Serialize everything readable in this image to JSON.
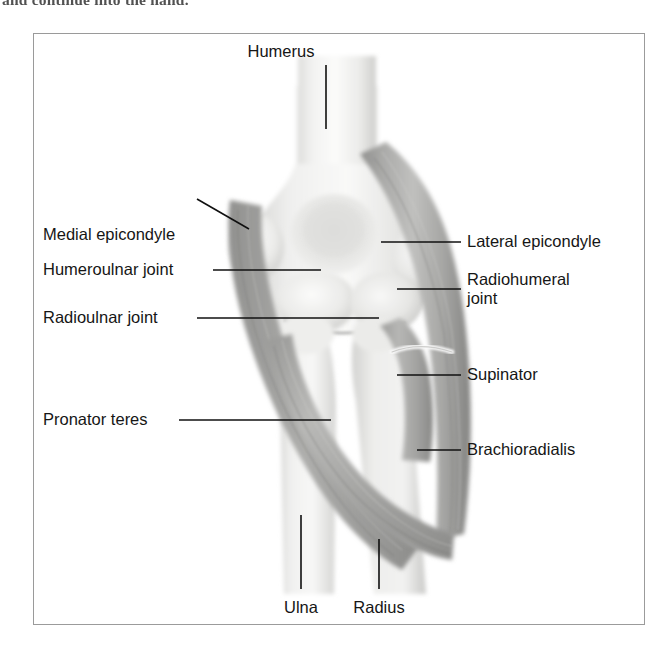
{
  "page": {
    "caption_above_figure": "and continue into the hand.",
    "figure_subject": "Anatomy of the elbow: bones and forearm muscles"
  },
  "figure": {
    "frame": {
      "x": 33,
      "y": 33,
      "width": 612,
      "height": 592,
      "border_color": "#9a9a9a"
    },
    "background_color": "#ffffff"
  },
  "labels": [
    {
      "id": "humerus",
      "text": "Humerus",
      "position": "top-center",
      "text_x": 325,
      "text_y": 52,
      "leader": {
        "type": "vertical",
        "x1": 325,
        "y1": 64,
        "x2": 325,
        "y2": 128
      }
    },
    {
      "id": "medial-epicondyle",
      "text": "Medial epicondyle",
      "position": "left",
      "text_x": 42,
      "text_y": 202,
      "leader": {
        "type": "diagonal",
        "x1": 196,
        "y1": 198,
        "x2": 248,
        "y2": 228
      }
    },
    {
      "id": "humeroulnar-joint",
      "text": "Humeroulnar joint",
      "position": "left",
      "text_x": 42,
      "text_y": 272,
      "leader": {
        "type": "horizontal",
        "x1": 212,
        "y1": 269,
        "x2": 320,
        "y2": 269
      }
    },
    {
      "id": "radioulnar-joint",
      "text": "Radioulnar joint",
      "position": "left",
      "text_x": 42,
      "text_y": 320,
      "leader": {
        "type": "horizontal",
        "x1": 196,
        "y1": 317,
        "x2": 378,
        "y2": 317
      }
    },
    {
      "id": "pronator-teres",
      "text": "Pronator teres",
      "position": "left",
      "text_x": 42,
      "text_y": 422,
      "leader": {
        "type": "horizontal",
        "x1": 178,
        "y1": 419,
        "x2": 330,
        "y2": 419
      }
    },
    {
      "id": "lateral-epicondyle",
      "text": "Lateral epicondyle",
      "position": "right",
      "text_x": 466,
      "text_y": 243,
      "leader": {
        "type": "horizontal",
        "x1": 380,
        "y1": 241,
        "x2": 460,
        "y2": 241
      }
    },
    {
      "id": "radiohumeral-joint",
      "text": "Radiohumeral joint",
      "position": "right",
      "text_x": 466,
      "text_y": 282,
      "line_1": "Radiohumeral",
      "line_2": "joint",
      "leader": {
        "type": "horizontal",
        "x1": 396,
        "y1": 288,
        "x2": 460,
        "y2": 288
      }
    },
    {
      "id": "supinator",
      "text": "Supinator",
      "position": "right",
      "text_x": 466,
      "text_y": 377,
      "leader": {
        "type": "horizontal",
        "x1": 396,
        "y1": 374,
        "x2": 460,
        "y2": 374
      }
    },
    {
      "id": "brachioradialis",
      "text": "Brachioradialis",
      "position": "right",
      "text_x": 466,
      "text_y": 452,
      "leader": {
        "type": "horizontal",
        "x1": 416,
        "y1": 449,
        "x2": 460,
        "y2": 449
      }
    },
    {
      "id": "ulna",
      "text": "Ulna",
      "position": "bottom",
      "text_x": 300,
      "text_y": 608,
      "leader": {
        "type": "vertical",
        "x1": 300,
        "y1": 514,
        "x2": 300,
        "y2": 588
      }
    },
    {
      "id": "radius",
      "text": "Radius",
      "position": "bottom",
      "text_x": 378,
      "text_y": 608,
      "leader": {
        "type": "vertical",
        "x1": 378,
        "y1": 538,
        "x2": 378,
        "y2": 588
      }
    }
  ],
  "anatomy": {
    "structures": [
      {
        "name": "humerus-shaft",
        "kind": "bone",
        "tone": "#f2f2f2"
      },
      {
        "name": "medial-epicondyle",
        "kind": "bone-process",
        "tone": "#e8e8e8"
      },
      {
        "name": "lateral-epicondyle",
        "kind": "bone-process",
        "tone": "#e4e4e4"
      },
      {
        "name": "trochlea-capitulum",
        "kind": "bone-condyle",
        "tone": "#ededed"
      },
      {
        "name": "ulna",
        "kind": "bone",
        "tone": "#efefef"
      },
      {
        "name": "radius",
        "kind": "bone",
        "tone": "#ebebeb"
      },
      {
        "name": "brachioradialis",
        "kind": "muscle",
        "tone": "#b4b4b4"
      },
      {
        "name": "supinator",
        "kind": "muscle",
        "tone": "#a8a8a8"
      },
      {
        "name": "pronator-teres",
        "kind": "muscle",
        "tone": "#aaaaaa"
      },
      {
        "name": "medial-muscle-band",
        "kind": "muscle",
        "tone": "#9f9f9f"
      },
      {
        "name": "radial-tendon",
        "kind": "tendon",
        "tone": "#fbfbfb"
      }
    ],
    "palette": {
      "bone_light": "#f5f5f5",
      "bone_mid": "#e2e2e2",
      "bone_shadow": "#c9c9c9",
      "muscle_light": "#c2c2c2",
      "muscle_mid": "#a6a6a6",
      "muscle_dark": "#8a8a8a",
      "leader_line": "#101010"
    }
  }
}
